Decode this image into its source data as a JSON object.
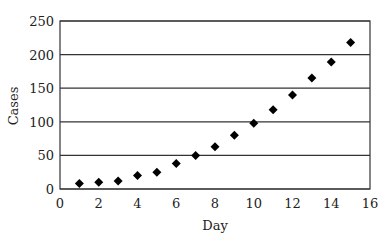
{
  "chart_data": {
    "type": "scatter",
    "title": "",
    "xlabel": "Day",
    "ylabel": "Cases",
    "xlim": [
      0,
      16
    ],
    "ylim": [
      0,
      250
    ],
    "xticks": [
      0,
      2,
      4,
      6,
      8,
      10,
      12,
      14,
      16
    ],
    "yticks": [
      0,
      50,
      100,
      150,
      200,
      250
    ],
    "grid": {
      "horizontal": true,
      "vertical": false
    },
    "legend": null,
    "marker": "diamond",
    "series": [
      {
        "name": "Cases",
        "x": [
          1,
          2,
          3,
          4,
          5,
          6,
          7,
          8,
          9,
          10,
          11,
          12,
          13,
          14,
          15
        ],
        "y": [
          8,
          10,
          12,
          20,
          25,
          38,
          50,
          63,
          80,
          98,
          118,
          140,
          165,
          189,
          218
        ]
      }
    ]
  },
  "colors": {
    "marker": "#000000",
    "gridline": "#333333",
    "axis": "#333333",
    "background": "#ffffff"
  }
}
